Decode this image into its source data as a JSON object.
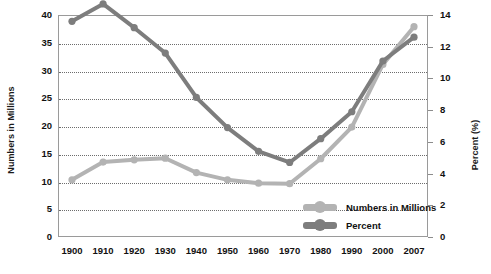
{
  "chart_data": {
    "type": "line",
    "title": "",
    "xlabel": "",
    "ylabel": "Numbers in Millions",
    "y2label": "Percent (%)",
    "categories": [
      "1900",
      "1910",
      "1920",
      "1930",
      "1940",
      "1950",
      "1960",
      "1970",
      "1980",
      "1990",
      "2000",
      "2007"
    ],
    "ylim": [
      0,
      40
    ],
    "yticks": [
      "0",
      "5",
      "10",
      "15",
      "20",
      "25",
      "30",
      "35",
      "40"
    ],
    "y2lim": [
      0,
      14
    ],
    "y2ticks": [
      "0",
      "2",
      "4",
      "6",
      "8",
      "10",
      "12",
      "14"
    ],
    "grid": true,
    "legend_position": "inside-bottom-right",
    "series": [
      {
        "name": "Numbers in Millions",
        "axis": "left",
        "color": "#b3b3b3",
        "values": [
          10.3,
          13.5,
          13.9,
          14.2,
          11.6,
          10.3,
          9.7,
          9.6,
          14.1,
          19.8,
          31.1,
          37.9
        ]
      },
      {
        "name": "Percent",
        "axis": "right",
        "color": "#7d7d7d",
        "values": [
          13.6,
          14.7,
          13.2,
          11.6,
          8.8,
          6.9,
          5.4,
          4.7,
          6.2,
          7.9,
          11.1,
          12.6
        ]
      }
    ]
  },
  "legend": {
    "items": [
      {
        "label": "Numbers in Millions",
        "color": "#b3b3b3"
      },
      {
        "label": "Percent",
        "color": "#7d7d7d"
      }
    ]
  },
  "colors": {
    "light_series": "#b3b3b3",
    "dark_series": "#7d7d7d",
    "axis": "#9a9a9a",
    "grid": "#6d6d6d",
    "text": "#111111",
    "background": "#ffffff"
  }
}
